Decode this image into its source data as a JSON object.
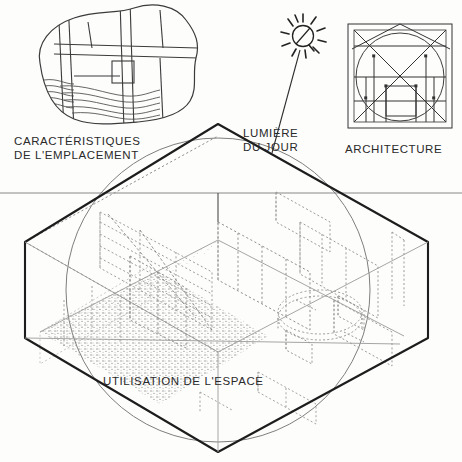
{
  "page": {
    "background_color": "#fdfdfc",
    "ink_color": "#2a2a2a",
    "width": 462,
    "height": 462
  },
  "labels": {
    "site": "CARACTÉRISTIQUES\nDE L'EMPLACEMENT",
    "daylight": "LUMIÈRE\nDU JOUR",
    "architecture": "ARCHITECTURE",
    "space": "UTILISATION DE L'ESPACE"
  },
  "icons": {
    "site_plan": "site-plan-blob-icon",
    "sun": "sun-icon",
    "sun_ray": "sun-ray-line",
    "proportion_square": "architecture-proportion-diagram-icon",
    "horizon": "horizon-line",
    "hexagon_volume": "isometric-room-volume",
    "big_circle": "enclosing-circle",
    "floor_texture": "stippled-floor-plane",
    "furniture": "dotted-furniture-outlines",
    "round_table": "round-table-icon"
  },
  "geometry": {
    "circle": {
      "cx": 218,
      "cy": 290,
      "r": 152
    },
    "hexagon": [
      [
        218,
        124
      ],
      [
        428,
        242
      ],
      [
        428,
        338
      ],
      [
        218,
        452
      ],
      [
        25,
        338
      ],
      [
        25,
        242
      ]
    ],
    "horizon_y": 193,
    "sun": {
      "cx": 303,
      "cy": 36,
      "r": 11
    },
    "ray_end": [
      272,
      153
    ]
  }
}
